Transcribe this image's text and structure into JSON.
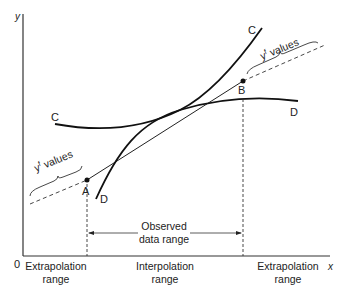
{
  "axes": {
    "y_label": "y",
    "x_label": "x",
    "origin_label": "0"
  },
  "curves": {
    "curve_c": {
      "label_left": "C",
      "label_right": "C"
    },
    "curve_d": {
      "label_left": "D",
      "label_right": "D"
    },
    "tangent_line": {
      "description": "straight line through A and B"
    }
  },
  "points": {
    "a": "A",
    "b": "B"
  },
  "braces": {
    "left": {
      "text": "y",
      "superscript": "f",
      "suffix": " values"
    },
    "right": {
      "text": "y",
      "superscript": "f",
      "suffix": " values"
    }
  },
  "observed": {
    "line1": "Observed",
    "line2": "data range"
  },
  "ranges": {
    "left": {
      "line1": "Extrapolation",
      "line2": "range"
    },
    "middle": {
      "line1": "Interpolation",
      "line2": "range"
    },
    "right": {
      "line1": "Extrapolation",
      "line2": "range"
    }
  }
}
